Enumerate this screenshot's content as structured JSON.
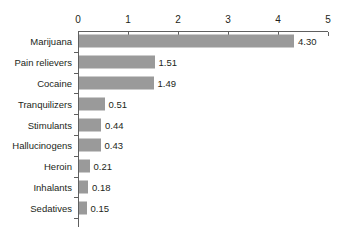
{
  "chart_data": {
    "type": "bar",
    "orientation": "horizontal",
    "title": "",
    "subtitle": "",
    "xlabel": "",
    "ylabel": "",
    "xlim": [
      0,
      5
    ],
    "grid": false,
    "legend": false,
    "legend_position": "none",
    "axis": {
      "tick_labels": [
        "0",
        "1",
        "2",
        "3",
        "4",
        "5"
      ],
      "tick_values": [
        0,
        1,
        2,
        3,
        4,
        5
      ],
      "position": "top"
    },
    "bar_color": "#9a9a9a",
    "axis_color": "#5f5f5f",
    "text_color": "#231f20",
    "background_color": "#ffffff",
    "categories": [
      "Marijuana",
      "Pain relievers",
      "Cocaine",
      "Tranquilizers",
      "Stimulants",
      "Hallucinogens",
      "Heroin",
      "Inhalants",
      "Sedatives"
    ],
    "values": [
      4.3,
      1.51,
      1.49,
      0.51,
      0.44,
      0.43,
      0.21,
      0.18,
      0.15
    ],
    "value_labels": [
      "4.30",
      "1.51",
      "1.49",
      "0.51",
      "0.44",
      "0.43",
      "0.21",
      "0.18",
      "0.15"
    ]
  }
}
